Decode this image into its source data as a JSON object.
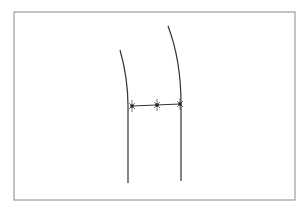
{
  "diagram": {
    "frame": {
      "x": 14,
      "y": 12,
      "width": 281,
      "height": 188,
      "stroke": "#8a8a8a"
    },
    "stroke_color": "#333333",
    "curves": [
      {
        "name": "left-curve",
        "path": "M120,50 Q128,78 128,106 L128,183"
      },
      {
        "name": "right-curve",
        "path": "M168,26 Q181,60 181,104 L181,181"
      }
    ],
    "connector": {
      "x1": 132,
      "y1": 106,
      "x2": 180,
      "y2": 104
    },
    "markers": [
      {
        "x": 132,
        "y": 106
      },
      {
        "x": 157,
        "y": 105
      },
      {
        "x": 180,
        "y": 104
      }
    ]
  }
}
